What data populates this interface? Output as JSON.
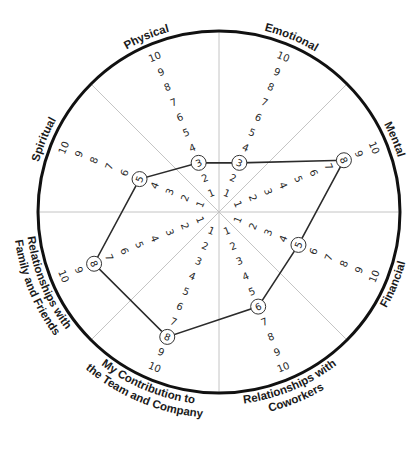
{
  "chart_data": {
    "type": "radar",
    "title": "",
    "scale": {
      "min": 1,
      "max": 10,
      "ticks": [
        1,
        2,
        3,
        4,
        5,
        6,
        7,
        8,
        9,
        10
      ]
    },
    "categories": [
      "Emotional",
      "Mental",
      "Financial",
      "Relationships with Coworkers",
      "My Contribution to the Team and Company",
      "Relationships with Family and Friends",
      "Spiritual",
      "Physical"
    ],
    "values": [
      3,
      8,
      5,
      6,
      8,
      8,
      5,
      3
    ],
    "grid": "8 gray dividing spokes",
    "legend": "none"
  },
  "wheel": {
    "center": [
      219,
      212
    ],
    "radius": 181,
    "unit_px": 16.4,
    "colors": {
      "outer_ring": "#111111",
      "spokes": "#c4c4c4",
      "polygon": "#2b2b2b",
      "numbers": "#2a2a2a"
    },
    "segments": [
      {
        "label_lines": [
          "Emotional"
        ],
        "angle": -67.5,
        "value": 3
      },
      {
        "label_lines": [
          "Mental"
        ],
        "angle": -22.5,
        "value": 8
      },
      {
        "label_lines": [
          "Financial"
        ],
        "angle": 22.5,
        "value": 5
      },
      {
        "label_lines": [
          "Relationships with",
          "Coworkers"
        ],
        "angle": 67.5,
        "value": 6
      },
      {
        "label_lines": [
          "My Contribution to",
          "the Team and Company"
        ],
        "angle": 112.5,
        "value": 8
      },
      {
        "label_lines": [
          "Relationships with",
          "Family and Friends"
        ],
        "angle": 157.5,
        "value": 8
      },
      {
        "label_lines": [
          "Spiritual"
        ],
        "angle": -157.5,
        "value": 5
      },
      {
        "label_lines": [
          "Physical"
        ],
        "angle": -112.5,
        "value": 3
      }
    ]
  }
}
